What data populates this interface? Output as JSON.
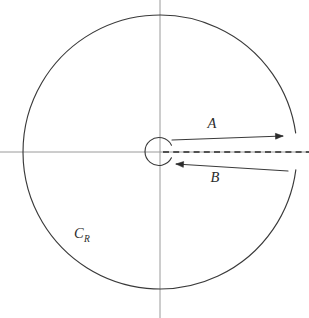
{
  "figure": {
    "type": "complex-analysis-contour",
    "background_color": "#ffffff",
    "canvas": {
      "width": 309,
      "height": 318
    },
    "labels": {
      "branch_a": "A",
      "branch_b": "B",
      "big_circle_base": "C",
      "big_circle_subscript": "R"
    },
    "colors": {
      "contour": "#3a3a3a",
      "axis": "#9a9a9a",
      "branch_cut": "#2b2b2b",
      "label": "#2b2b2b"
    },
    "geometry": {
      "origin": {
        "x": 160,
        "y": 152
      },
      "big_circle": {
        "name": "C_R",
        "center_x": 160,
        "center_y": 152,
        "radius": 137,
        "gap_start_deg": -7.5,
        "gap_end_deg": 8.0
      },
      "small_circle": {
        "name": "epsilon-circle",
        "center_x": 159,
        "center_y": 151.5,
        "radius": 14,
        "gap_start_deg": -27,
        "gap_end_deg": 27
      },
      "axis_vertical": {
        "x": 160,
        "y1": 0,
        "y2": 318
      },
      "axis_horizontal": {
        "y": 152,
        "x1": 0,
        "x2": 309
      },
      "branch_cut_line": {
        "y": 152,
        "x1": 163,
        "x2": 309
      },
      "segment_a": {
        "label": "A",
        "direction": "rightward",
        "x1": 172,
        "y1": 140,
        "x2": 283,
        "y2": 136,
        "arrow_at": "end",
        "label_x": 212,
        "label_y": 128
      },
      "segment_b": {
        "label": "B",
        "direction": "leftward",
        "x1": 288,
        "y1": 171,
        "x2": 176,
        "y2": 164,
        "arrow_at": "end",
        "label_x": 215,
        "label_y": 182
      },
      "label_cr": {
        "x": 74,
        "y": 238
      }
    }
  }
}
